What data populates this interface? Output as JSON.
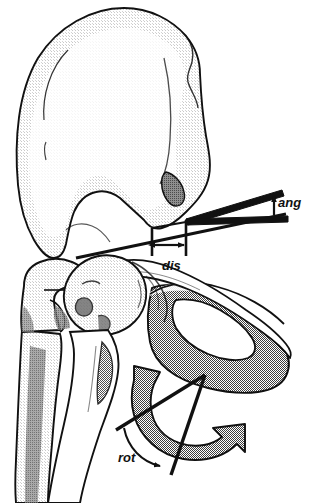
{
  "figure": {
    "background_color": "#ffffff",
    "line_color": "#111111"
  },
  "annotations": [
    {
      "id": "ang",
      "label": "ang",
      "icon": "angle-wedge-icon",
      "meaning": "angular measurement",
      "label_x": 278,
      "label_y": 203
    },
    {
      "id": "dis",
      "label": "dis",
      "icon": "double-arrow-icon",
      "meaning": "linear distance measurement",
      "label_x": 168,
      "label_y": 266
    },
    {
      "id": "rot",
      "label": "rot",
      "icon": "curved-rotation-arrow-icon",
      "meaning": "rotational measurement",
      "label_x": 124,
      "label_y": 457
    }
  ],
  "anatomy": [
    {
      "id": "ilium",
      "name": "Ilium / iliac wing",
      "shade": "light"
    },
    {
      "id": "acetabulum",
      "name": "Acetabulum",
      "shade": "light"
    },
    {
      "id": "femoral-head",
      "name": "Femoral head",
      "shade": "light"
    },
    {
      "id": "femoral-neck",
      "name": "Femoral neck",
      "shade": "light"
    },
    {
      "id": "greater-trochanter",
      "name": "Greater trochanter",
      "shade": "light"
    },
    {
      "id": "femoral-shaft",
      "name": "Femoral shaft",
      "shade": "light"
    },
    {
      "id": "superior-pubic-ramus",
      "name": "Superior pubic ramus",
      "shade": "medium"
    },
    {
      "id": "ischium",
      "name": "Ischium",
      "shade": "medium"
    },
    {
      "id": "obturator-foramen",
      "name": "Obturator foramen",
      "shade": "none"
    },
    {
      "id": "aiis-marking",
      "name": "Anterior inferior iliac spine marking",
      "shade": "dark"
    }
  ],
  "shades": {
    "light": "#e2e2e2",
    "medium": "#9d9d9d",
    "dark": "#8a8a8a",
    "line": "#111111",
    "white": "#ffffff"
  }
}
